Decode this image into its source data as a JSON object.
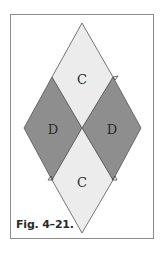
{
  "figure": {
    "caption": "Fig. 4–21.",
    "colors": {
      "light_piece": "#ececec",
      "dark_piece": "#8e8e8e",
      "outline": "#555555",
      "frame": "#8a8a8a"
    },
    "pieces": [
      {
        "id": "top",
        "label": "C",
        "shade": "light"
      },
      {
        "id": "left",
        "label": "D",
        "shade": "dark"
      },
      {
        "id": "right",
        "label": "D",
        "shade": "dark"
      },
      {
        "id": "bottom",
        "label": "C",
        "shade": "light"
      }
    ],
    "markers": [
      {
        "type": "triangle",
        "position": "upper-right"
      },
      {
        "type": "triangle",
        "position": "lower-left"
      },
      {
        "type": "triangle",
        "position": "lower-right"
      }
    ]
  }
}
